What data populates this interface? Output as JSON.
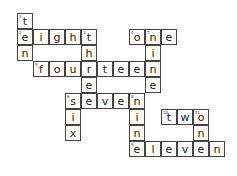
{
  "puzzle": {
    "cell_size": 16,
    "origin": {
      "x": 17,
      "y": 13
    },
    "cells": [
      {
        "r": 0,
        "c": 0,
        "letter": "t",
        "num": "1"
      },
      {
        "r": 1,
        "c": 0,
        "letter": "e",
        "num": "2"
      },
      {
        "r": 1,
        "c": 1,
        "letter": "i"
      },
      {
        "r": 1,
        "c": 2,
        "letter": "g"
      },
      {
        "r": 1,
        "c": 3,
        "letter": "h"
      },
      {
        "r": 1,
        "c": 4,
        "letter": "t",
        "num": "3"
      },
      {
        "r": 2,
        "c": 0,
        "letter": "n"
      },
      {
        "r": 2,
        "c": 4,
        "letter": "h"
      },
      {
        "r": 3,
        "c": 1,
        "letter": "f",
        "num": "5"
      },
      {
        "r": 3,
        "c": 2,
        "letter": "o"
      },
      {
        "r": 3,
        "c": 3,
        "letter": "u"
      },
      {
        "r": 3,
        "c": 4,
        "letter": "r"
      },
      {
        "r": 3,
        "c": 5,
        "letter": "t"
      },
      {
        "r": 3,
        "c": 6,
        "letter": "e"
      },
      {
        "r": 3,
        "c": 7,
        "letter": "e"
      },
      {
        "r": 3,
        "c": 8,
        "letter": "n"
      },
      {
        "r": 4,
        "c": 4,
        "letter": "e"
      },
      {
        "r": 4,
        "c": 8,
        "letter": "e"
      },
      {
        "r": 5,
        "c": 3,
        "letter": "s",
        "num": "6"
      },
      {
        "r": 5,
        "c": 4,
        "letter": "e"
      },
      {
        "r": 5,
        "c": 5,
        "letter": "v"
      },
      {
        "r": 5,
        "c": 6,
        "letter": "e"
      },
      {
        "r": 5,
        "c": 7,
        "letter": "n",
        "num": "8"
      },
      {
        "r": 6,
        "c": 3,
        "letter": "i"
      },
      {
        "r": 6,
        "c": 7,
        "letter": "i"
      },
      {
        "r": 6,
        "c": 9,
        "letter": "t",
        "num": "10"
      },
      {
        "r": 6,
        "c": 10,
        "letter": "w"
      },
      {
        "r": 6,
        "c": 11,
        "letter": "o",
        "num": "11"
      },
      {
        "r": 7,
        "c": 3,
        "letter": "x"
      },
      {
        "r": 7,
        "c": 7,
        "letter": "n"
      },
      {
        "r": 7,
        "c": 11,
        "letter": "n"
      },
      {
        "r": 8,
        "c": 7,
        "letter": "e",
        "num": "9"
      },
      {
        "r": 8,
        "c": 8,
        "letter": "l"
      },
      {
        "r": 8,
        "c": 9,
        "letter": "e"
      },
      {
        "r": 8,
        "c": 10,
        "letter": "v"
      },
      {
        "r": 8,
        "c": 11,
        "letter": "e"
      },
      {
        "r": 8,
        "c": 12,
        "letter": "n"
      },
      {
        "r": 1,
        "c": 7,
        "letter": "o",
        "num": "4"
      },
      {
        "r": 1,
        "c": 8,
        "letter": "n",
        "num": "7"
      },
      {
        "r": 1,
        "c": 9,
        "letter": "e"
      },
      {
        "r": 2,
        "c": 8,
        "letter": "i"
      }
    ]
  }
}
